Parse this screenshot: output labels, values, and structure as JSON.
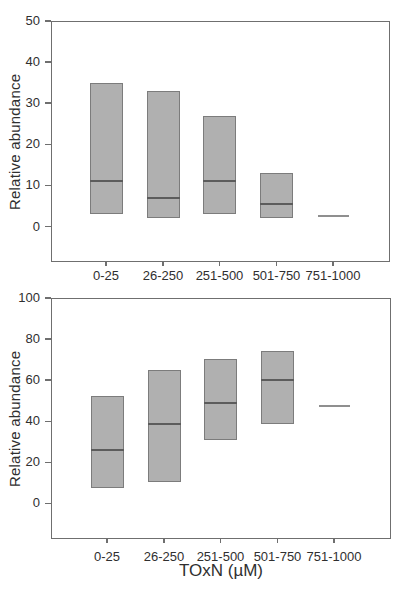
{
  "figure": {
    "background": "#ffffff",
    "box_fill": "#b0b0b0",
    "box_border": "#7c7c7c",
    "median_color": "#5c5c5c",
    "single_line_color": "#8f8f8f",
    "axis_color": "#6f6f6f",
    "text_color": "#2f2f2f"
  },
  "chart_data": [
    {
      "type": "box-range",
      "title": "",
      "ylabel": "Relative abundance",
      "xlabel": "",
      "categories": [
        "0-25",
        "26-250",
        "251-500",
        "501-750",
        "751-1000"
      ],
      "yticks": [
        0,
        10,
        20,
        30,
        40,
        50
      ],
      "ylim": [
        0,
        50
      ],
      "grid": false,
      "legend": null,
      "series": [
        {
          "category": "0-25",
          "low": 3,
          "median": 11,
          "high": 35
        },
        {
          "category": "26-250",
          "low": 2,
          "median": 7,
          "high": 33
        },
        {
          "category": "251-500",
          "low": 3,
          "median": 11,
          "high": 27
        },
        {
          "category": "501-750",
          "low": 2,
          "median": 5.5,
          "high": 13
        },
        {
          "category": "751-1000",
          "value": 2.5,
          "line_only": true
        }
      ]
    },
    {
      "type": "box-range",
      "title": "",
      "ylabel": "Relative abundance",
      "xlabel": "TOxN (µM)",
      "categories": [
        "0-25",
        "26-250",
        "251-500",
        "501-750",
        "751-1000"
      ],
      "yticks": [
        0,
        20,
        40,
        60,
        80,
        100
      ],
      "ylim": [
        0,
        100
      ],
      "grid": false,
      "legend": null,
      "series": [
        {
          "category": "0-25",
          "low": 7.5,
          "median": 26,
          "high": 52.5
        },
        {
          "category": "26-250",
          "low": 10.5,
          "median": 38.5,
          "high": 65
        },
        {
          "category": "251-500",
          "low": 31,
          "median": 49,
          "high": 70.5
        },
        {
          "category": "501-750",
          "low": 38.5,
          "median": 60,
          "high": 74
        },
        {
          "category": "751-1000",
          "value": 47.5,
          "line_only": true
        }
      ]
    }
  ]
}
